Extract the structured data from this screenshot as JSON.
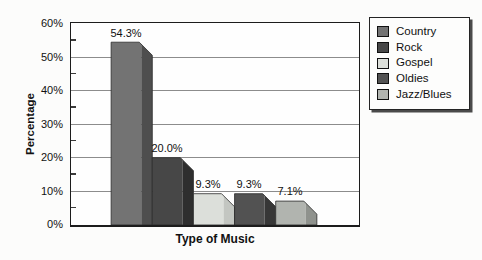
{
  "chart_data": {
    "type": "bar",
    "title": "",
    "xlabel": "Type of Music",
    "ylabel": "Percentage",
    "ylim": [
      0,
      60
    ],
    "y_major_step": 10,
    "y_minor_step": 5,
    "y_tick_labels": [
      "60%",
      "50%",
      "40%",
      "30%",
      "20%",
      "10%",
      "0%"
    ],
    "grid": "horizontal-major",
    "bar_style": "3d-beveled",
    "legend_position": "right",
    "categories": [
      "Country",
      "Rock",
      "Gospel",
      "Oldies",
      "Jazz/Blues"
    ],
    "values": [
      54.3,
      20.0,
      9.3,
      9.3,
      7.1
    ],
    "value_labels": [
      "54.3%",
      "20.0%",
      "9.3%",
      "9.3%",
      "7.1%"
    ],
    "legend": [
      "Country",
      "Rock",
      "Gospel",
      "Oldies",
      "Jazz/Blues"
    ],
    "bar_colors": [
      {
        "face": "#737373",
        "side": "#4e4e4e"
      },
      {
        "face": "#474747",
        "side": "#2e2e2e"
      },
      {
        "face": "#dcdfda",
        "side": "#c3c6c1"
      },
      {
        "face": "#525252",
        "side": "#373737"
      },
      {
        "face": "#b1b4af",
        "side": "#8f928d"
      }
    ],
    "grid_color": "#8c8c8c",
    "axis_color": "#1c1c1c",
    "text_color": "#111111"
  }
}
